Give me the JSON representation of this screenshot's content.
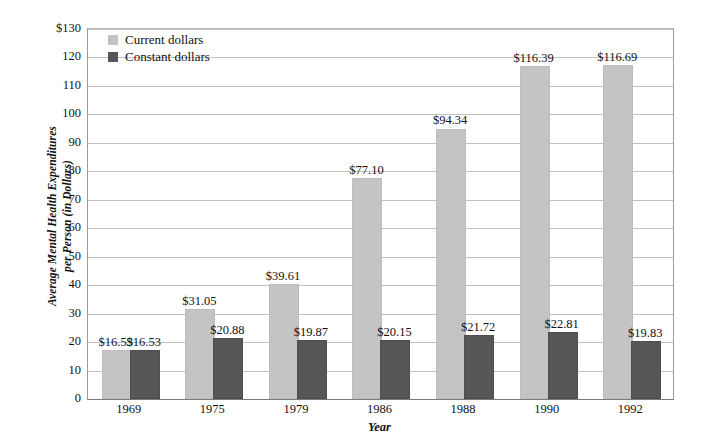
{
  "chart_data": {
    "type": "bar",
    "title": "",
    "xlabel": "Year",
    "ylabel": "Average Mental Health Expenditures per Person (in Dollars)",
    "ylabel_line1": "Average Mental Health Expenditures",
    "ylabel_line2": "per Person (in Dollars)",
    "categories": [
      "1969",
      "1975",
      "1979",
      "1986",
      "1988",
      "1990",
      "1992"
    ],
    "series": [
      {
        "name": "Current dollars",
        "color": "#c4c4c4",
        "values": [
          16.53,
          31.05,
          39.61,
          77.1,
          94.34,
          116.39,
          116.69
        ],
        "labels": [
          "$16.53",
          "$31.05",
          "$39.61",
          "$77.10",
          "$94.34",
          "$116.39",
          "$116.69"
        ]
      },
      {
        "name": "Constant dollars",
        "color": "#565656",
        "values": [
          16.53,
          20.88,
          19.87,
          20.15,
          21.72,
          22.81,
          19.83
        ],
        "labels": [
          "$16.53",
          "$20.88",
          "$19.87",
          "$20.15",
          "$21.72",
          "$22.81",
          "$19.83"
        ]
      }
    ],
    "ylim": [
      0,
      130
    ],
    "yticks": [
      0,
      10,
      20,
      30,
      40,
      50,
      60,
      70,
      80,
      90,
      100,
      110,
      120,
      130
    ],
    "ytick_labels": [
      "0",
      "10",
      "20",
      "30",
      "40",
      "50",
      "60",
      "70",
      "80",
      "90",
      "100",
      "110",
      "120",
      "$130"
    ],
    "grid": "horizontal",
    "legend_position": "upper-left-inside"
  },
  "legend": {
    "items": [
      {
        "label": "Current dollars",
        "color": "#c4c4c4"
      },
      {
        "label": "Constant dollars",
        "color": "#565656"
      }
    ]
  }
}
